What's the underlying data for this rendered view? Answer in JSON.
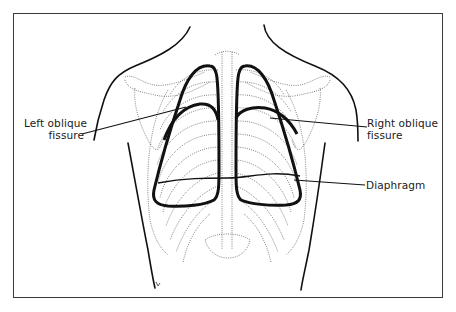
{
  "figure": {
    "title": "",
    "labels": {
      "left_fissure": {
        "line1": "Left oblique",
        "line2": "fissure"
      },
      "right_fissure": {
        "line1": "Right oblique",
        "line2": "fissure"
      },
      "diaphragm": "Diaphragm"
    },
    "colors": {
      "outline": "#111111",
      "skeleton": "#555555",
      "border": "#3a3a3a",
      "background": "#ffffff"
    }
  }
}
